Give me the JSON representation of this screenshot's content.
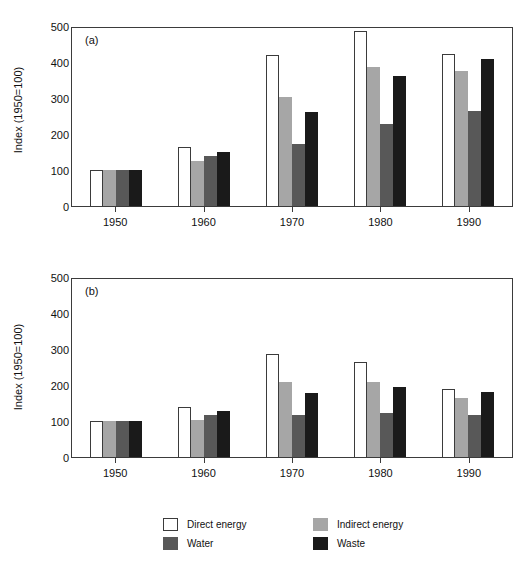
{
  "figure": {
    "background": "#ffffff",
    "panels": [
      {
        "tag": "(a)",
        "ylabel": "Index (1950=100)"
      },
      {
        "tag": "(b)",
        "ylabel": "Index (1950=100)"
      }
    ]
  },
  "legend": {
    "position": "bottom-center",
    "entries": [
      {
        "label": "Direct energy",
        "color": "#ffffff",
        "swatch": "s0"
      },
      {
        "label": "Indirect energy",
        "color": "#a6a6a6",
        "swatch": "s1"
      },
      {
        "label": "Water",
        "color": "#585858",
        "swatch": "s2"
      },
      {
        "label": "Waste",
        "color": "#1a1a1a",
        "swatch": "s3"
      }
    ]
  },
  "axis": {
    "yticks": [
      "0",
      "100",
      "200",
      "300",
      "400",
      "500"
    ],
    "xticks": [
      "1950",
      "1960",
      "1970",
      "1980",
      "1990"
    ]
  },
  "chart_data": [
    {
      "type": "bar",
      "title": "(a)",
      "xlabel": "",
      "ylabel": "Index (1950=100)",
      "ylim": [
        0,
        500
      ],
      "yticks": [
        0,
        100,
        200,
        300,
        400,
        500
      ],
      "grid": false,
      "legend_position": "bottom",
      "categories": [
        "1950",
        "1960",
        "1970",
        "1980",
        "1990"
      ],
      "series": [
        {
          "name": "Direct energy",
          "color": "#ffffff",
          "values": [
            100,
            163,
            420,
            486,
            423
          ]
        },
        {
          "name": "Indirect energy",
          "color": "#a6a6a6",
          "values": [
            100,
            125,
            303,
            385,
            375
          ]
        },
        {
          "name": "Water",
          "color": "#585858",
          "values": [
            100,
            138,
            172,
            227,
            265
          ]
        },
        {
          "name": "Waste",
          "color": "#1a1a1a",
          "values": [
            100,
            151,
            261,
            362,
            408
          ]
        }
      ]
    },
    {
      "type": "bar",
      "title": "(b)",
      "xlabel": "",
      "ylabel": "Index (1950=100)",
      "ylim": [
        0,
        500
      ],
      "yticks": [
        0,
        100,
        200,
        300,
        400,
        500
      ],
      "grid": false,
      "legend_position": "bottom",
      "categories": [
        "1950",
        "1960",
        "1970",
        "1980",
        "1990"
      ],
      "series": [
        {
          "name": "Direct energy",
          "color": "#ffffff",
          "values": [
            100,
            140,
            285,
            265,
            188
          ]
        },
        {
          "name": "Indirect energy",
          "color": "#a6a6a6",
          "values": [
            100,
            104,
            207,
            209,
            165
          ]
        },
        {
          "name": "Water",
          "color": "#585858",
          "values": [
            100,
            117,
            116,
            122,
            116
          ]
        },
        {
          "name": "Waste",
          "color": "#1a1a1a",
          "values": [
            100,
            127,
            178,
            195,
            180
          ]
        }
      ]
    }
  ]
}
